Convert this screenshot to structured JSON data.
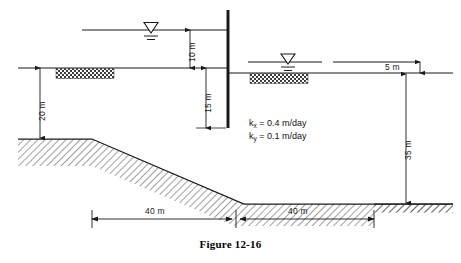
{
  "figure": {
    "caption": "Figure 12-16"
  },
  "dimensions": {
    "head_upstream": "10 m",
    "pile_embedment": "15 m",
    "left_soil_depth": "20 m",
    "downstream_head": "5 m",
    "right_soil_depth": "35 m",
    "slope_run_left": "40 m",
    "slope_run_right": "40 m"
  },
  "permeability": {
    "kx_symbol": "k",
    "kx_subscript": "x",
    "kx_value": "= 0.4 m/day",
    "ky_symbol": "k",
    "ky_subscript": "y",
    "ky_value": "= 0.1 m/day",
    "kx_full": "k_x = 0.4 m/day",
    "ky_full": "k_y = 0.1 m/day"
  },
  "elements": {
    "sheet_pile_wall": "sheet-pile-wall",
    "upstream_water_surface": "upstream-water-surface",
    "downstream_water_surface": "downstream-water-surface",
    "ground_surface": "ground-surface",
    "impervious_base": "impervious-base",
    "filter_left": "left-filter-blanket",
    "filter_right": "right-filter-blanket",
    "water_table_symbol_left": "water-table-triangle-left",
    "water_table_symbol_right": "water-table-triangle-right"
  },
  "colors": {
    "line": "#1a1a1a",
    "hatch": "#2b2b2b",
    "background": "#ffffff"
  }
}
